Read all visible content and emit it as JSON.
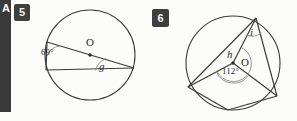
{
  "page": {
    "width": 297,
    "height": 121,
    "background": "#fcfcfa",
    "ink": "#2a2a2a"
  },
  "chrome": {
    "left_strip_glyph": "A",
    "left_strip_color": "#3a3a3a"
  },
  "problems": [
    {
      "number": "5",
      "badge_color": "#3f3f3f",
      "figure": {
        "shape": "circle-with-inscribed-triangle",
        "center_label": "O",
        "labels": [
          {
            "name": "inscribed-angle-69",
            "text": "69°"
          },
          {
            "name": "central-angle-g",
            "text": "g"
          }
        ]
      }
    },
    {
      "number": "6",
      "badge_color": "#3f3f3f",
      "figure": {
        "shape": "circle-with-inscribed-quadrilateral",
        "center_label": "O",
        "labels": [
          {
            "name": "inscribed-angle-i",
            "text": "i"
          },
          {
            "name": "reflex-angle-h",
            "text": "h"
          },
          {
            "name": "central-angle-112",
            "text": "112°"
          }
        ]
      }
    }
  ],
  "figure5": {
    "angle_69": "69°",
    "angle_g": "g",
    "center": "O"
  },
  "figure6": {
    "angle_i": "i",
    "angle_h": "h",
    "angle_112": "112°",
    "center": "O"
  }
}
